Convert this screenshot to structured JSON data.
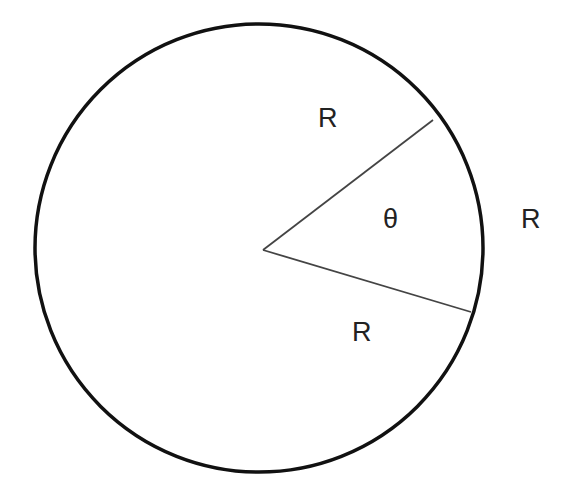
{
  "diagram": {
    "type": "circle-sector",
    "circle": {
      "cx": 259,
      "cy": 248,
      "r": 224,
      "stroke": "#111111",
      "stroke_width": 3.5
    },
    "center_point": {
      "x": 263,
      "y": 250
    },
    "radii": [
      {
        "x2": 433,
        "y2": 120
      },
      {
        "x2": 471,
        "y2": 312
      }
    ],
    "line_color": "#444444",
    "labels": {
      "radius_upper": "R",
      "arc_length": "R",
      "radius_lower": "R",
      "angle": "θ"
    }
  }
}
